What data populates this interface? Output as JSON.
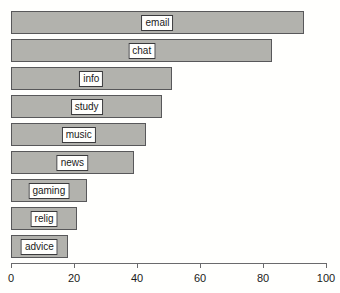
{
  "chart_data": {
    "type": "bar",
    "orientation": "horizontal",
    "title": "",
    "xlabel": "",
    "ylabel": "",
    "xlim": [
      0,
      100
    ],
    "grid": false,
    "legend": null,
    "categories": [
      "email",
      "chat",
      "info",
      "study",
      "music",
      "news",
      "gaming",
      "relig",
      "advice"
    ],
    "values": [
      93,
      83,
      51,
      48,
      43,
      39,
      24,
      21,
      18
    ],
    "xticks": [
      0,
      20,
      40,
      60,
      80,
      100
    ],
    "xtick_labels": [
      "0",
      "20",
      "40",
      "60",
      "80",
      "100"
    ],
    "bars": [
      {
        "label": "email",
        "value": 93,
        "top": 11,
        "height": 23
      },
      {
        "label": "chat",
        "value": 83,
        "top": 39,
        "height": 23
      },
      {
        "label": "info",
        "value": 51,
        "top": 67,
        "height": 23
      },
      {
        "label": "study",
        "value": 48,
        "top": 95,
        "height": 23
      },
      {
        "label": "music",
        "value": 43,
        "top": 123,
        "height": 23
      },
      {
        "label": "news",
        "value": 39,
        "top": 151,
        "height": 23
      },
      {
        "label": "gaming",
        "value": 24,
        "top": 179,
        "height": 23
      },
      {
        "label": "relig",
        "value": 21,
        "top": 207,
        "height": 23
      },
      {
        "label": "advice",
        "value": 18,
        "top": 235,
        "height": 23
      }
    ],
    "colors": {
      "bar_fill": "#b2b2ad",
      "bar_border": "#58585a",
      "label_box_fill": "#fffffd",
      "label_box_border": "#3a3a3c",
      "axis": "#6a6a6c",
      "text": "#1a1a1a",
      "background": "#fffffd"
    }
  }
}
